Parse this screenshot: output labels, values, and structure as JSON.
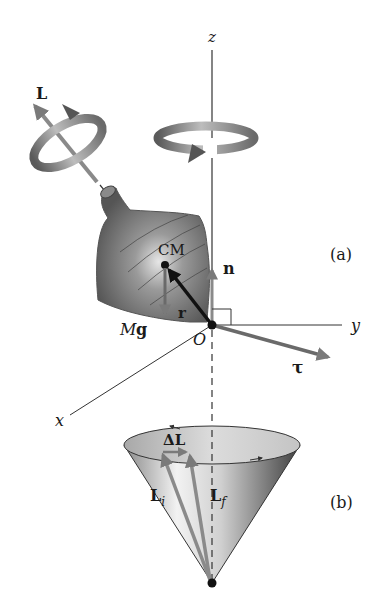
{
  "figure": {
    "panel_a_label": "(a)",
    "panel_b_label": "(b)",
    "axes": {
      "z_label": "z",
      "y_label": "y",
      "x_label": "x",
      "origin_label": "O"
    },
    "vectors": {
      "angular_momentum_label": "L",
      "normal_force_label": "n",
      "position_label": "r",
      "weight_label_M": "M",
      "weight_label_g": "g",
      "torque_label": "τ",
      "center_of_mass_label": "CM"
    },
    "cone": {
      "delta_L_label": "ΔL",
      "L_initial_main": "L",
      "L_initial_sub": "i",
      "L_final_main": "L",
      "L_final_sub": "f"
    },
    "colors": {
      "axis": "#333333",
      "vector_gray": "#7a7a7a",
      "vector_dark": "#111111",
      "top_body": "#6e6e6e"
    }
  }
}
